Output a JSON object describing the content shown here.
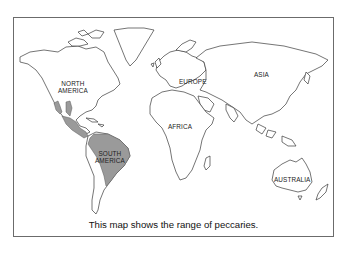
{
  "map": {
    "title": "World map of peccary range",
    "caption": "This map shows the range of peccaries.",
    "labels": {
      "north_america_1": "NORTH",
      "north_america_2": "AMERICA",
      "south_america_1": "SOUTH",
      "south_america_2": "AMERICA",
      "europe": "EUROPE",
      "asia": "ASIA",
      "africa": "AFRICA",
      "australia": "AUSTRALIA"
    },
    "colors": {
      "land": "#ffffff",
      "outline": "#3a3a3a",
      "range_shading": "#9a9a9a",
      "frame": "#6b6b6b"
    },
    "legend": {
      "shaded_meaning": "range of peccaries",
      "shaded_regions": [
        "southwestern North America",
        "Mexico",
        "Central America",
        "South America (north and central)"
      ]
    }
  }
}
